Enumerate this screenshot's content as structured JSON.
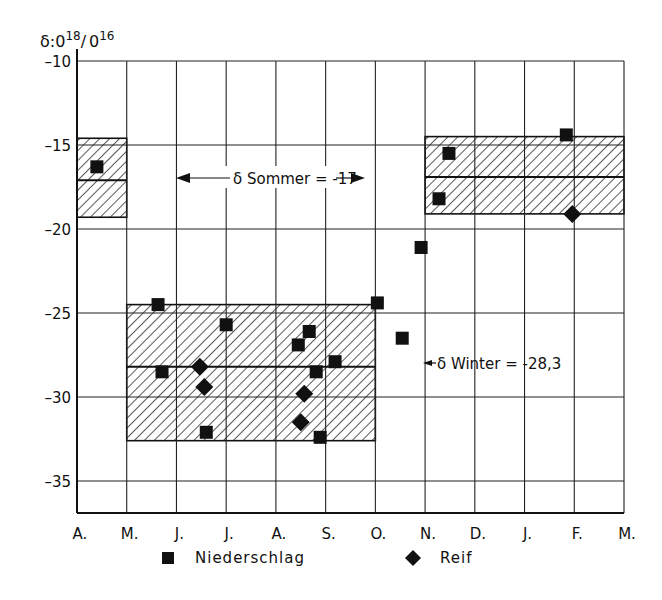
{
  "chart_data": {
    "type": "scatter",
    "title": "",
    "ylabel": "δ:O18/O16",
    "ylabel_parts": {
      "delta": "δ:",
      "o1": "0",
      "sup1": "18",
      "slash": "/",
      "o2": "0",
      "sup2": "16"
    },
    "xlabel": "",
    "ylim": [
      -36.9,
      -10
    ],
    "yticks": [
      -10,
      -15,
      -20,
      -25,
      -30,
      -35
    ],
    "ytick_labels": [
      "-10",
      "-15",
      "-20",
      "-25",
      "-30",
      "-35"
    ],
    "x_categories": [
      "A.",
      "M.",
      "J.",
      "J.",
      "A.",
      "S.",
      "O.",
      "N.",
      "D.",
      "J.",
      "F.",
      "M."
    ],
    "xlim": [
      0,
      11
    ],
    "grid": true,
    "series": [
      {
        "name": "Niederschlag",
        "marker": "square",
        "points": [
          [
            0.4,
            -16.3
          ],
          [
            1.63,
            -24.5
          ],
          [
            1.71,
            -28.5
          ],
          [
            2.6,
            -32.1
          ],
          [
            3.0,
            -25.7
          ],
          [
            4.45,
            -26.9
          ],
          [
            4.67,
            -26.1
          ],
          [
            4.81,
            -28.5
          ],
          [
            4.89,
            -32.4
          ],
          [
            5.19,
            -27.9
          ],
          [
            6.04,
            -24.4
          ],
          [
            6.54,
            -26.5
          ],
          [
            6.92,
            -21.1
          ],
          [
            7.28,
            -18.2
          ],
          [
            7.48,
            -15.5
          ],
          [
            9.84,
            -14.4
          ]
        ]
      },
      {
        "name": "Reif",
        "marker": "diamond",
        "points": [
          [
            2.47,
            -28.2
          ],
          [
            2.56,
            -29.4
          ],
          [
            4.5,
            -31.5
          ],
          [
            4.57,
            -29.8
          ],
          [
            9.96,
            -19.1
          ]
        ]
      }
    ],
    "ranges": [
      {
        "name": "Sommer (Apr)",
        "x0": 0,
        "x1": 1,
        "ymax": -14.6,
        "ymin": -19.3,
        "mean": -17.1
      },
      {
        "name": "Winter",
        "x0": 1,
        "x1": 6,
        "ymax": -24.5,
        "ymin": -32.6,
        "mean": -28.2
      },
      {
        "name": "Sommer (Nov-Feb)",
        "x0": 7,
        "x1": 11,
        "ymax": -14.5,
        "ymin": -19.1,
        "mean": -16.9
      }
    ],
    "annotations": [
      {
        "text": "δ Sommer = -17",
        "x0": 2,
        "x1": 6,
        "y": -17.1,
        "type": "double-arrow"
      },
      {
        "text": "δ Winter = -28,3",
        "x": 6.05,
        "y": -28.2,
        "type": "arrow-left"
      }
    ],
    "legend": {
      "position": "bottom",
      "entries": [
        {
          "label": "Niederschlag",
          "marker": "square"
        },
        {
          "label": "Reif",
          "marker": "diamond"
        }
      ]
    }
  },
  "labels": {
    "sommer": "δ Sommer = -17",
    "winter": "δ Winter = -28,3",
    "legend_square": "Niederschlag",
    "legend_diamond": "Reif"
  }
}
